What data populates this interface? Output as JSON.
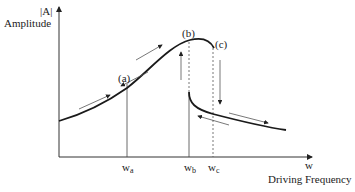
{
  "diagram": {
    "y_axis": {
      "label_top": "|A|",
      "label": "Amplitude"
    },
    "x_axis": {
      "symbol": "w",
      "label": "Driving Frequency"
    },
    "points": [
      {
        "id": "a",
        "label": "(a)"
      },
      {
        "id": "b",
        "label": "(b)"
      },
      {
        "id": "c",
        "label": "(c)"
      }
    ],
    "ticks": [
      {
        "base": "w",
        "sub": "a"
      },
      {
        "base": "w",
        "sub": "b"
      },
      {
        "base": "w",
        "sub": "c"
      }
    ],
    "colors": {
      "curve": "#1a1a1a",
      "axis": "#333333",
      "guides": "#555555"
    }
  }
}
